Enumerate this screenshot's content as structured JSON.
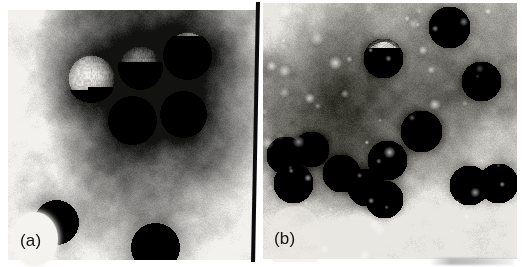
{
  "figure": {
    "width": 526,
    "height": 267,
    "background": "#ffffff",
    "type": "transmission-electron-micrograph-pair",
    "divider": {
      "name": "vertical-black-divider",
      "color": "#0b0b0b",
      "x": 256,
      "width": 4,
      "slant_deg": -1.1
    },
    "bottom_smudge": {
      "visible": true,
      "color": "#7d7d7d"
    }
  },
  "panels": [
    {
      "id": "a",
      "label": "(a)",
      "label_badge": "white-oval",
      "x": 8,
      "y": 10,
      "width": 248,
      "height": 250,
      "background_description": "negative-stain electron micrograph, bright grey at left edge grading to very dark stain pool in upper centre-right",
      "tone": {
        "light": "#f2f1ee",
        "mid": "#9a9893",
        "dark": "#2a2926",
        "darkest": "#121210"
      },
      "particle_style": "smooth bright granular core with soft diffuse dark halo",
      "particle_radius_px": 23,
      "particles": [
        {
          "cx": 83,
          "cy": 68,
          "r": 24
        },
        {
          "cx": 132,
          "cy": 57,
          "r": 22
        },
        {
          "cx": 179,
          "cy": 45,
          "r": 24
        },
        {
          "cx": 124,
          "cy": 110,
          "r": 24
        },
        {
          "cx": 175,
          "cy": 104,
          "r": 23
        },
        {
          "cx": 48,
          "cy": 212,
          "r": 22
        },
        {
          "cx": 147,
          "cy": 237,
          "r": 24
        }
      ]
    },
    {
      "id": "b",
      "label": "(b)",
      "label_badge": "pale-rounded-patch",
      "x": 263,
      "y": 3,
      "width": 254,
      "height": 256,
      "background_description": "negative-stain electron micrograph, dark stain band across upper-left and centre, paler grainy field in lower half with scattered bright specks",
      "tone": {
        "light": "#e9e7e2",
        "mid": "#8e8c87",
        "dark": "#353330",
        "darkest": "#17160f"
      },
      "particle_style": "dark-rimmed icosahedral capsid with bright spiky capsomer texture",
      "particle_radius_px": 19,
      "particles": [
        {
          "cx": 120,
          "cy": 55,
          "r": 20
        },
        {
          "cx": 186,
          "cy": 24,
          "r": 21
        },
        {
          "cx": 218,
          "cy": 78,
          "r": 20
        },
        {
          "cx": 158,
          "cy": 128,
          "r": 21
        },
        {
          "cx": 22,
          "cy": 152,
          "r": 19
        },
        {
          "cx": 48,
          "cy": 146,
          "r": 18
        },
        {
          "cx": 30,
          "cy": 180,
          "r": 20
        },
        {
          "cx": 78,
          "cy": 170,
          "r": 19
        },
        {
          "cx": 103,
          "cy": 184,
          "r": 19
        },
        {
          "cx": 124,
          "cy": 157,
          "r": 20
        },
        {
          "cx": 121,
          "cy": 196,
          "r": 19
        },
        {
          "cx": 206,
          "cy": 182,
          "r": 20
        },
        {
          "cx": 235,
          "cy": 180,
          "r": 20
        }
      ],
      "speck_count": 60
    }
  ]
}
